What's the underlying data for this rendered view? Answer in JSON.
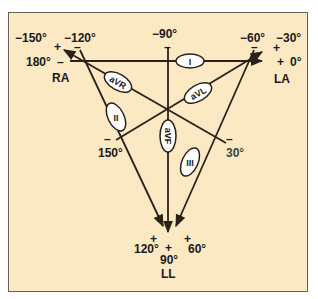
{
  "diagram": {
    "colors": {
      "background": "#fbe9c4",
      "line": "#2a2118",
      "border": "#6b6256",
      "text": "#1a1a1a",
      "ellipse_fill": "#ffffff"
    },
    "electrodes": {
      "ra": "RA",
      "la": "LA",
      "ll": "LL"
    },
    "leads": {
      "I": "I",
      "II": "II",
      "III": "III",
      "aVR": "aVR",
      "aVL": "aVL",
      "aVF": "aVF"
    },
    "angles": {
      "m150": "−150°",
      "m120": "−120°",
      "m90": "−90°",
      "m60": "−60°",
      "m30": "−30°",
      "a180": "180°",
      "a0": "0°",
      "a150": "150°",
      "a30": "30°",
      "a120": "120°",
      "a90": "90°",
      "a60": "60°"
    },
    "signs": {
      "plus": "+",
      "minus": "–"
    }
  }
}
